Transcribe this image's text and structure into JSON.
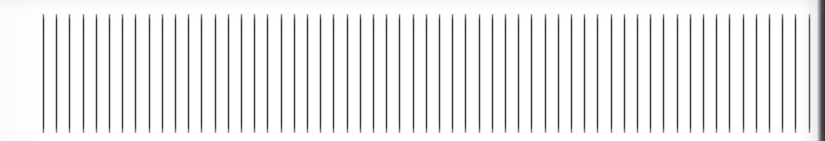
{
  "image": {
    "kind": "scanned-ruled-line-pattern",
    "width_px": 825,
    "height_px": 141,
    "background_color": "#ffffff",
    "alt_text": "Dense row of evenly spaced thin vertical dark lines on a white background"
  },
  "pattern": {
    "line_count": 60,
    "line_color": "#3b3b3d",
    "line_halo_color": "rgba(120,120,126,0.40)",
    "line_width_px": 1,
    "spacing_px": 13.2,
    "field_left_px": 43,
    "field_top_px": 14,
    "field_width_px": 778,
    "field_height_px": 119,
    "orientation": "vertical"
  },
  "artifacts": {
    "scan_tint_color": "#f4f4f6",
    "edge_shadow_color": "#343438",
    "edge_shadow_width_px": 9,
    "edge_shadow_side": "right"
  }
}
